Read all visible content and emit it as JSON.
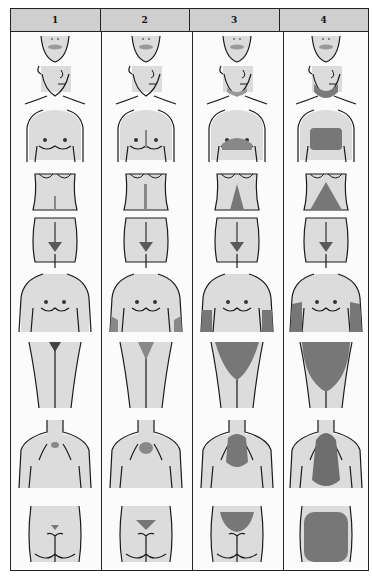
{
  "columns": [
    {
      "score_label": "1"
    },
    {
      "score_label": "2"
    },
    {
      "score_label": "3"
    },
    {
      "score_label": "4"
    }
  ],
  "rows": [
    {
      "region": "upper-lip"
    },
    {
      "region": "chin"
    },
    {
      "region": "chest"
    },
    {
      "region": "upper-abdomen"
    },
    {
      "region": "lower-abdomen"
    },
    {
      "region": "upper-arm"
    },
    {
      "region": "thigh"
    },
    {
      "region": "upper-back"
    },
    {
      "region": "lower-back"
    }
  ],
  "colors": {
    "skin": "#d9d9d9",
    "hair_light": "#9a9a9a",
    "hair_dark": "#6e6e6e",
    "outline": "#1a1a1a",
    "header_bg": "#cfcfcf"
  }
}
